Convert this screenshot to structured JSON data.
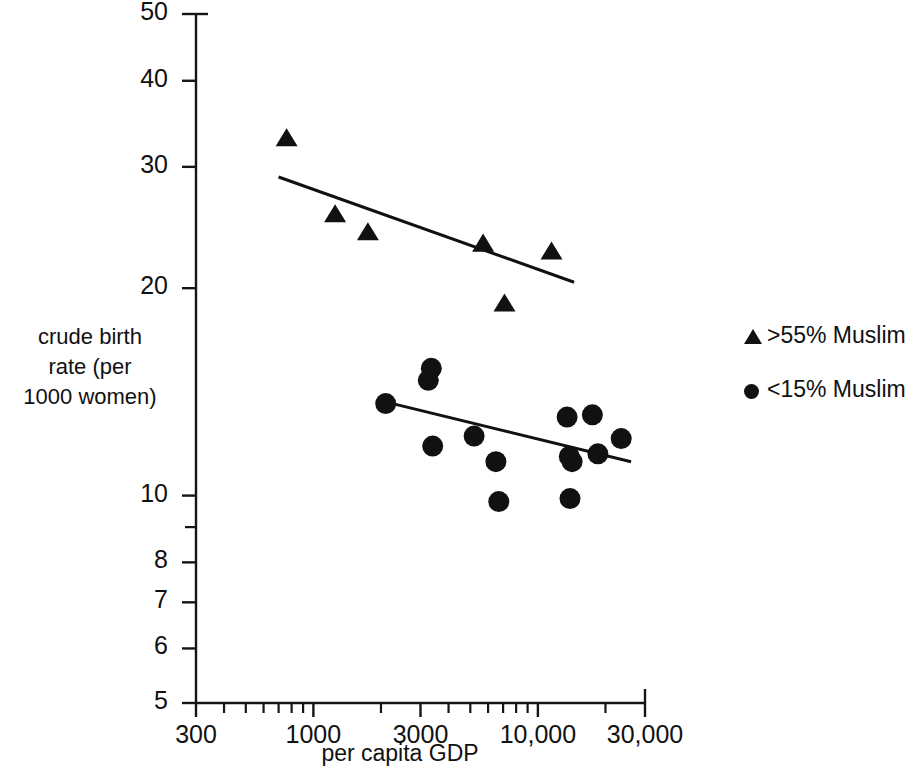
{
  "chart_data": {
    "type": "scatter",
    "title": "",
    "xlabel": "per capita GDP",
    "ylabel": "crude birth rate (per 1000 women)",
    "ylabel_lines": [
      "crude birth",
      "rate (per",
      "1000 women)"
    ],
    "xscale": "log",
    "yscale": "log",
    "xlim": [
      300,
      30000
    ],
    "ylim": [
      5,
      50
    ],
    "grid": false,
    "legend_position": "right",
    "xticks": [
      {
        "value": 300,
        "label": "300"
      },
      {
        "value": 1000,
        "label": "1000"
      },
      {
        "value": 3000,
        "label": "3000"
      },
      {
        "value": 10000,
        "label": "10,000"
      },
      {
        "value": 30000,
        "label": "30,000"
      }
    ],
    "x_minor_ticks": [
      400,
      500,
      600,
      700,
      800,
      900,
      2000,
      4000,
      5000,
      6000,
      7000,
      8000,
      9000,
      20000
    ],
    "yticks": [
      {
        "value": 50,
        "label": "50"
      },
      {
        "value": 40,
        "label": "40"
      },
      {
        "value": 30,
        "label": "30"
      },
      {
        "value": 20,
        "label": "20"
      },
      {
        "value": 10,
        "label": "10"
      },
      {
        "value": 8,
        "label": "8"
      },
      {
        "value": 7,
        "label": "7"
      },
      {
        "value": 6,
        "label": "6"
      },
      {
        "value": 5,
        "label": "5"
      }
    ],
    "y_minor_ticks": [
      9
    ],
    "series": [
      {
        "name": ">55% Muslim",
        "marker": "triangle",
        "color": "#111111",
        "points": [
          {
            "x": 760,
            "y": 33.0
          },
          {
            "x": 1250,
            "y": 25.6
          },
          {
            "x": 1750,
            "y": 24.1
          },
          {
            "x": 5700,
            "y": 23.2
          },
          {
            "x": 11500,
            "y": 22.6
          },
          {
            "x": 7100,
            "y": 19.0
          }
        ],
        "trendline": {
          "x1": 700,
          "y1": 29.0,
          "x2": 14500,
          "y2": 20.4
        }
      },
      {
        "name": "<15% Muslim",
        "marker": "circle",
        "color": "#111111",
        "points": [
          {
            "x": 2100,
            "y": 13.6
          },
          {
            "x": 3350,
            "y": 15.3
          },
          {
            "x": 3250,
            "y": 14.7
          },
          {
            "x": 3400,
            "y": 11.8
          },
          {
            "x": 5200,
            "y": 12.2
          },
          {
            "x": 6500,
            "y": 11.2
          },
          {
            "x": 6700,
            "y": 9.8
          },
          {
            "x": 13500,
            "y": 13.0
          },
          {
            "x": 17500,
            "y": 13.1
          },
          {
            "x": 13800,
            "y": 11.4
          },
          {
            "x": 14200,
            "y": 11.2
          },
          {
            "x": 13900,
            "y": 9.9
          },
          {
            "x": 18500,
            "y": 11.5
          },
          {
            "x": 23500,
            "y": 12.1
          }
        ],
        "trendline": {
          "x1": 2050,
          "y1": 13.7,
          "x2": 26000,
          "y2": 11.2
        }
      }
    ],
    "legend": [
      {
        "marker": "triangle",
        "label": ">55% Muslim"
      },
      {
        "marker": "circle",
        "label": "<15% Muslim"
      }
    ]
  }
}
